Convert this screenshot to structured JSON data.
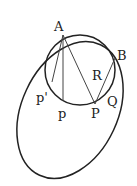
{
  "diagram": {
    "labels": {
      "A": "A",
      "B": "B",
      "R": "R",
      "p_prime": "p'",
      "p": "p",
      "P": "P",
      "Q": "Q"
    },
    "stroke_color": "#222222"
  }
}
